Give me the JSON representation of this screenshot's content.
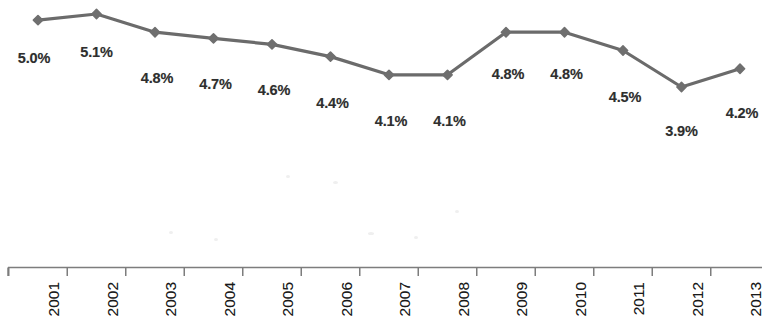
{
  "chart_data": {
    "type": "line",
    "title": "",
    "subtitle": "",
    "xlabel": "",
    "ylabel": "",
    "categories": [
      "2001",
      "2002",
      "2003",
      "2004",
      "2005",
      "2006",
      "2007",
      "2008",
      "2009",
      "2010",
      "2011",
      "2012",
      "2013"
    ],
    "values": [
      5.0,
      5.1,
      4.8,
      4.7,
      4.6,
      4.4,
      4.1,
      4.1,
      4.8,
      4.8,
      4.5,
      3.9,
      4.2
    ],
    "value_labels": [
      "5.0%",
      "5.1%",
      "4.8%",
      "4.7%",
      "4.6%",
      "4.4%",
      "4.1%",
      "4.1%",
      "4.8%",
      "4.8%",
      "4.5%",
      "3.9%",
      "4.2%"
    ],
    "ylim": [
      3.9,
      5.1
    ],
    "grid": false,
    "legend": false,
    "legend_position": "none",
    "y_axis_visible": false,
    "x_axis_visible": true,
    "tick_label_rotation": 90,
    "marker": "diamond",
    "data_labels_shown": true,
    "series": [
      {
        "name": "",
        "values": [
          5.0,
          5.1,
          4.8,
          4.7,
          4.6,
          4.4,
          4.1,
          4.1,
          4.8,
          4.8,
          4.5,
          3.9,
          4.2
        ]
      }
    ]
  },
  "style": {
    "line_color": "#6b6b6b",
    "marker_color": "#6f6f6f",
    "label_color": "#2e2e2e",
    "axis_color": "#7d7d7d",
    "tick_label_color": "#1a1a1a",
    "background": "#ffffff"
  }
}
